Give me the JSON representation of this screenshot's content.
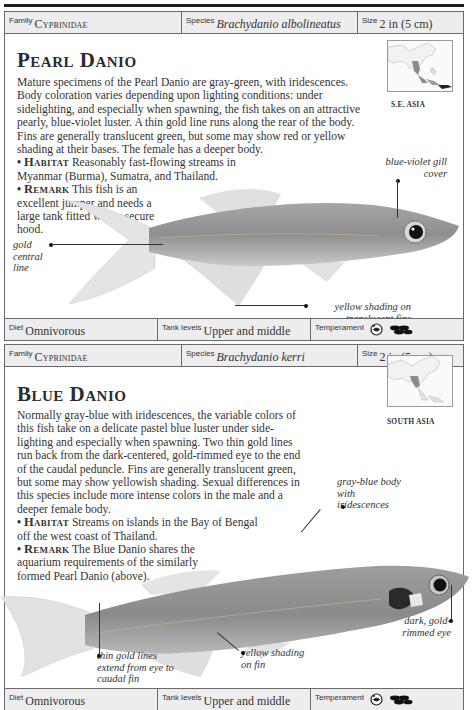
{
  "entries": [
    {
      "id": "pearl-danio",
      "header": {
        "family_label": "Family",
        "family_value": "Cyprinidae",
        "species_label": "Species",
        "species_value": "Brachydanio albolineatus",
        "size_label": "Size",
        "size_value": "2 in (5 cm)"
      },
      "title": "Pearl Danio",
      "description": "Mature specimens of the Pearl Danio are gray-green, with iridescences. Body coloration varies depending upon lighting conditions: under sidelighting, and especially when spawning, the fish takes on an attractive pearly, blue-violet luster. A thin gold line runs along the rear of the body. Fins are generally translucent green, but some may show red or yellow shading at their bases. The female has a deeper body.",
      "habitat_label": "Habitat",
      "habitat_text": "Reasonably fast-flowing streams in Myanmar (Burma), Sumatra, and Thailand.",
      "remark_label": "Remark",
      "remark_text": "This fish is an excellent jumper and needs a large tank fitted with a secure hood.",
      "map_caption": "S.E. ASIA",
      "callouts": {
        "gill": "blue-violet gill cover",
        "central_line": "gold central line",
        "fins": "yellow shading on translucent fins"
      },
      "footer": {
        "diet_label": "Diet",
        "diet_value": "Omnivorous",
        "tank_label": "Tank levels",
        "tank_value": "Upper and middle",
        "temperament_label": "Temperament",
        "temperament_icons": [
          "peaceful-fish-icon",
          "school-icon"
        ]
      }
    },
    {
      "id": "blue-danio",
      "header": {
        "family_label": "Family",
        "family_value": "Cyprinidae",
        "species_label": "Species",
        "species_value": "Brachydanio kerri",
        "size_label": "Size",
        "size_value": "2 in (5 cm)"
      },
      "title": "Blue Danio",
      "description": "Normally gray-blue with iridescences, the variable colors of this fish take on a delicate pastel blue luster under side-lighting and especially when spawning. Two thin gold lines run back from the dark-centered, gold-rimmed eye to the end of the caudal peduncle. Fins are generally translucent green, but some may show yellowish shading. Sexual differences in this species include more intense colors in the male and a deeper female body.",
      "habitat_label": "Habitat",
      "habitat_text": "Streams on islands in the Bay of Bengal off the west coast of Thailand.",
      "remark_label": "Remark",
      "remark_text": "The Blue Danio shares the aquarium requirements of the similarly formed Pearl Danio (above).",
      "map_caption": "SOUTH ASIA",
      "callouts": {
        "body": "gray-blue body with iridescences",
        "eye": "dark, gold-rimmed eye",
        "gold_lines": "thin gold lines extend from eye to caudal fin",
        "fin": "yellow shading on fin"
      },
      "footer": {
        "diet_label": "Diet",
        "diet_value": "Omnivorous",
        "tank_label": "Tank levels",
        "tank_value": "Upper and middle",
        "temperament_label": "Temperament",
        "temperament_icons": [
          "peaceful-fish-icon",
          "school-icon"
        ]
      }
    }
  ],
  "colors": {
    "bar_background": "#ededed",
    "border": "#6a6a6a",
    "text": "#333333",
    "map_range": "#8a8a8a"
  }
}
